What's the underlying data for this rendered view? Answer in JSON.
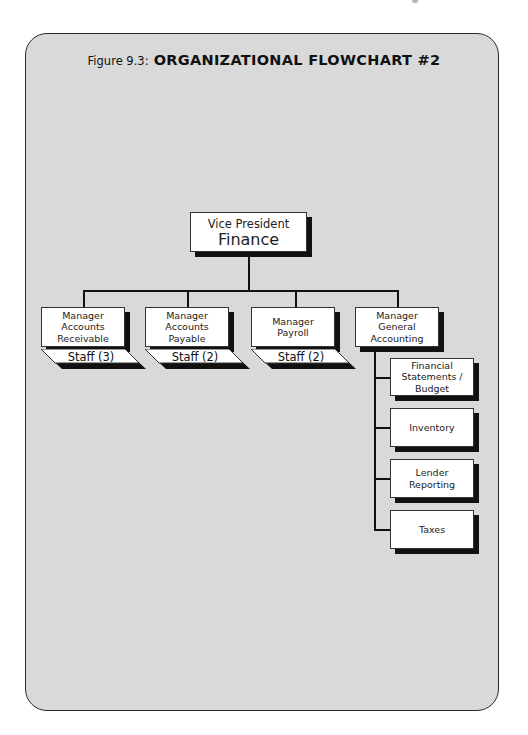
{
  "figure": {
    "label": "Figure 9.3:",
    "title": "ORGANIZATIONAL FLOWCHART #2"
  },
  "chart": {
    "root": {
      "line1": "Vice President",
      "line2": "Finance"
    },
    "managers": [
      {
        "lines": [
          "Manager",
          "Accounts",
          "Receivable"
        ],
        "staff": "Staff (3)"
      },
      {
        "lines": [
          "Manager",
          "Accounts",
          "Payable"
        ],
        "staff": "Staff (2)"
      },
      {
        "lines": [
          "Manager",
          "Payroll"
        ],
        "staff": "Staff (2)"
      },
      {
        "lines": [
          "Manager",
          "General",
          "Accounting"
        ],
        "staff": null
      }
    ],
    "general_accounting_functions": [
      {
        "lines": [
          "Financial",
          "Statements /",
          "Budget"
        ]
      },
      {
        "lines": [
          "Inventory"
        ]
      },
      {
        "lines": [
          "Lender",
          "Reporting"
        ]
      },
      {
        "lines": [
          "Taxes"
        ]
      }
    ]
  },
  "colors": {
    "panel": "#d9d9d9",
    "box": "#ffffff",
    "shadow": "#111111",
    "line": "#111111"
  }
}
